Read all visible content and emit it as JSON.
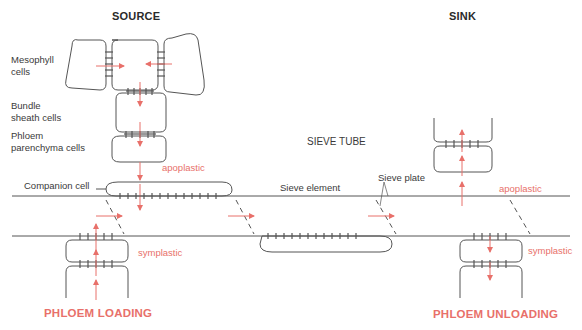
{
  "headers": {
    "source": "SOURCE",
    "sink": "SINK",
    "sieve_tube": "SIEVE TUBE"
  },
  "labels": {
    "mesophyll": [
      "Mesophyll",
      "cells"
    ],
    "bundle_sheath": [
      "Bundle",
      "sheath cells"
    ],
    "phloem_parenchyma": [
      "Phloem",
      "parenchyma cells"
    ],
    "companion_cell": "Companion cell",
    "sieve_element": "Sieve element",
    "sieve_plate": "Sieve plate"
  },
  "pathways": {
    "source_apoplastic": "apoplastic",
    "source_symplastic": "symplastic",
    "sink_apoplastic": "apoplastic",
    "sink_symplastic": "symplastic"
  },
  "processes": {
    "loading": "PHLOEM LOADING",
    "unloading": "PHLOEM UNLOADING"
  },
  "colors": {
    "accent": "#e8706a",
    "line": "#555555",
    "text": "#3a3a3a"
  }
}
